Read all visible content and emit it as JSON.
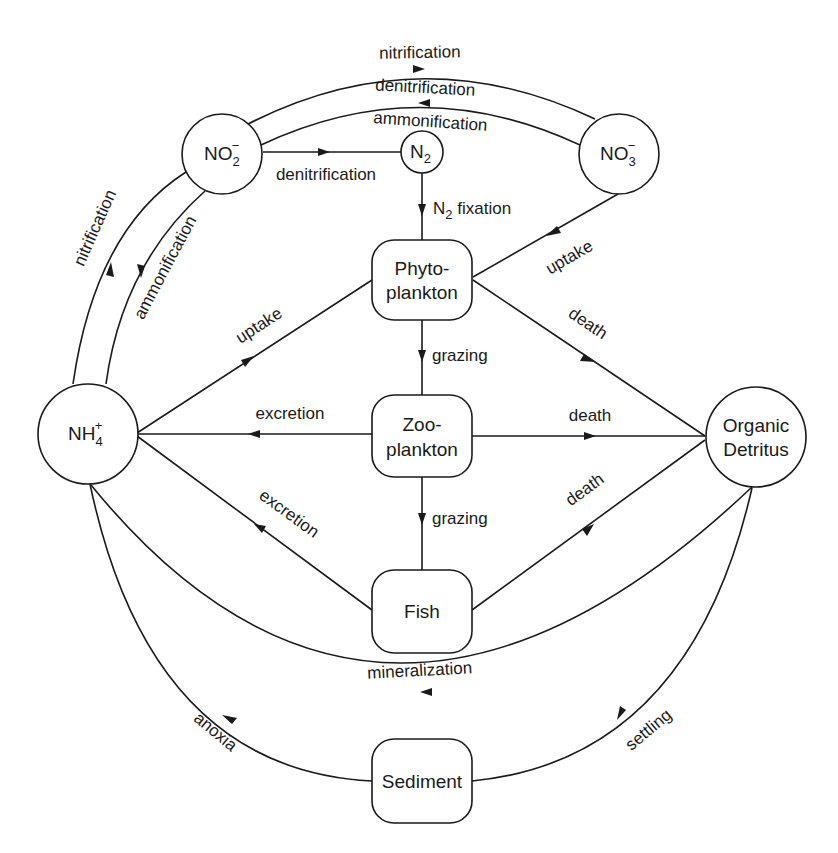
{
  "diagram": {
    "colors": {
      "stroke": "#1a1a1a",
      "background": "#ffffff"
    },
    "nodes": {
      "no2": {
        "shape": "circle",
        "label": "NO",
        "sub": "2",
        "sup": "−"
      },
      "n2": {
        "shape": "circle",
        "label": "N",
        "sub": "2"
      },
      "no3": {
        "shape": "circle",
        "label": "NO",
        "sub": "3",
        "sup": "−"
      },
      "nh4": {
        "shape": "circle",
        "label": "NH",
        "sub": "4",
        "sup": "+"
      },
      "detritus": {
        "shape": "circle",
        "line1": "Organic",
        "line2": "Detritus"
      },
      "phyto": {
        "shape": "rounded-box",
        "line1": "Phyto-",
        "line2": "plankton"
      },
      "zoo": {
        "shape": "rounded-box",
        "line1": "Zoo-",
        "line2": "plankton"
      },
      "fish": {
        "shape": "rounded-box",
        "label": "Fish"
      },
      "sediment": {
        "shape": "rounded-box",
        "label": "Sediment"
      }
    },
    "edges": {
      "nitrification_top": {
        "from": "NO2-",
        "to": "NO3-",
        "label": "nitrification"
      },
      "denitrification_top": {
        "from": "NO3-",
        "to": "NO2-",
        "label": "denitrification"
      },
      "ammonification_top": {
        "from": "NO3-",
        "to": "NO2-",
        "label": "ammonification"
      },
      "denitrification_n2": {
        "from": "NO2-",
        "to": "N2",
        "label": "denitrification"
      },
      "n2_fixation": {
        "from": "N2",
        "to": "Phytoplankton",
        "label_main": "N",
        "label_sub": "2",
        "label_rest": " fixation"
      },
      "uptake_no3": {
        "from": "NO3-",
        "to": "Phytoplankton",
        "label": "uptake"
      },
      "nitrification_left": {
        "from": "NH4+",
        "to": "NO2-",
        "label": "nitrification"
      },
      "ammonification_left": {
        "from": "NO2-",
        "to": "NH4+",
        "label": "ammonification"
      },
      "uptake_nh4": {
        "from": "NH4+",
        "to": "Phytoplankton",
        "label": "uptake"
      },
      "grazing_phyto": {
        "from": "Phytoplankton",
        "to": "Zooplankton",
        "label": "grazing"
      },
      "death_phyto": {
        "from": "Phytoplankton",
        "to": "Organic Detritus",
        "label": "death"
      },
      "excretion_zoo": {
        "from": "Zooplankton",
        "to": "NH4+",
        "label": "excretion"
      },
      "death_zoo": {
        "from": "Zooplankton",
        "to": "Organic Detritus",
        "label": "death"
      },
      "grazing_zoo": {
        "from": "Zooplankton",
        "to": "Fish",
        "label": "grazing"
      },
      "excretion_fish": {
        "from": "Fish",
        "to": "NH4+",
        "label": "excretion"
      },
      "death_fish": {
        "from": "Fish",
        "to": "Organic Detritus",
        "label": "death"
      },
      "mineralization": {
        "from": "Organic Detritus",
        "to": "NH4+",
        "label": "mineralization"
      },
      "settling": {
        "from": "Organic Detritus",
        "to": "Sediment",
        "label": "settling"
      },
      "anoxia": {
        "from": "Sediment",
        "to": "NH4+",
        "label": "anoxia"
      }
    }
  }
}
